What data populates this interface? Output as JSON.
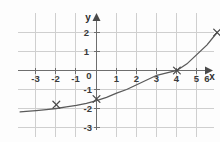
{
  "figure": {
    "title": "",
    "background_color": "#fdfdfd",
    "grid_color": "#cfcfcf",
    "axis_color": "#6e6e6e",
    "curve_color": "#5a5a5a",
    "marker_color": "#4a4a4a"
  },
  "axes": {
    "x_axis_label": "x",
    "y_axis_label": "y",
    "origin_label": "0"
  },
  "chart_data": {
    "type": "line",
    "title": "",
    "xlabel": "x",
    "ylabel": "y",
    "xlim": [
      -3.8,
      6.4
    ],
    "ylim": [
      -3.5,
      2.6
    ],
    "grid": true,
    "legend": null,
    "x_ticks": [
      -3,
      -2,
      -1,
      0,
      1,
      2,
      3,
      4,
      5,
      6
    ],
    "x_tick_labels": [
      "-3",
      "-2",
      "-1",
      "0",
      "1",
      "2",
      "3",
      "4",
      "5",
      "6"
    ],
    "y_ticks": [
      -3,
      -2,
      -1,
      0,
      1,
      2
    ],
    "y_tick_labels": [
      "-3",
      "-2",
      "-1",
      "0",
      "1",
      "2"
    ],
    "series": [
      {
        "name": "exponential curve",
        "kind": "line",
        "x": [
          -3.8,
          -3.5,
          -3,
          -2.5,
          -2,
          -1.5,
          -1,
          -0.5,
          0,
          0.5,
          1,
          1.5,
          2,
          2.5,
          3,
          3.5,
          4,
          4.5,
          5,
          5.5,
          6
        ],
        "y": [
          -2.18,
          -2.15,
          -2.11,
          -2.06,
          -2.0,
          -1.92,
          -1.84,
          -1.73,
          -1.59,
          -1.41,
          -1.19,
          -1.0,
          -0.75,
          -0.5,
          -0.25,
          -0.12,
          0.0,
          0.35,
          0.85,
          1.35,
          2.0
        ]
      }
    ],
    "markers": [
      {
        "label": "point-a",
        "x": -2,
        "y": -1.8,
        "symbol": "x"
      },
      {
        "label": "point-b",
        "x": 0,
        "y": -1.5,
        "symbol": "x"
      },
      {
        "label": "point-c",
        "x": 4,
        "y": 0,
        "symbol": "x"
      },
      {
        "label": "point-d",
        "x": 6,
        "y": 2,
        "symbol": "x"
      }
    ]
  }
}
